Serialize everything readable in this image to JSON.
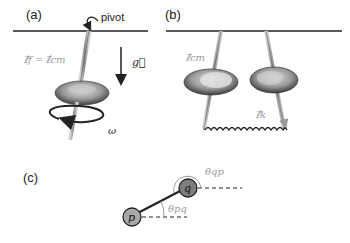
{
  "panels": {
    "a": {
      "label": "(a)",
      "pivot_label": "pivot",
      "lf_label": "ℓ⃗f = ℓ⃗cm",
      "g_label": "g⃗",
      "omega_label": "ω"
    },
    "b": {
      "label": "(b)",
      "lcm_label": "ℓ⃗cm",
      "lk_label": "ℓ⃗k"
    },
    "c": {
      "label": "(c)",
      "node_p": "p",
      "node_q": "q",
      "theta_qp": "θqp",
      "theta_pq": "θpq"
    }
  },
  "colors": {
    "line": "#222222",
    "rod": "#9a9a9a",
    "label_gray": "#9b9b9b",
    "node_p": "#a8a8a8",
    "node_q": "#7d7d7d"
  }
}
